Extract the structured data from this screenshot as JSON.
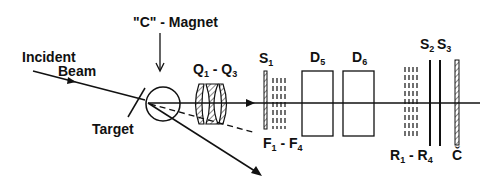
{
  "diagram": {
    "type": "experimental-setup-schematic",
    "labels": {
      "incident_beam_line1": "Incident",
      "incident_beam_line2": "Beam",
      "c_magnet": "\"C\" - Magnet",
      "target": "Target",
      "quads": {
        "a": "Q",
        "a_sub": "1",
        "sep": " - ",
        "b": "Q",
        "b_sub": "3"
      },
      "s1": {
        "main": "S",
        "sub": "1"
      },
      "d5": {
        "main": "D",
        "sub": "5"
      },
      "d6": {
        "main": "D",
        "sub": "6"
      },
      "f": {
        "a": "F",
        "a_sub": "1",
        "sep": " - ",
        "b": "F",
        "b_sub": "4"
      },
      "r": {
        "a": "R",
        "a_sub": "1",
        "sep": " - ",
        "b": "R",
        "b_sub": "4"
      },
      "s2": {
        "main": "S",
        "sub": "2"
      },
      "s3": {
        "main": "S",
        "sub": "3"
      },
      "cherenkov": "Č"
    },
    "components": [
      "incident-beam",
      "target",
      "c-magnet",
      "quadrupoles-Q1-Q3",
      "scintillator-S1",
      "chambers-F1-F4",
      "drift-chamber-D5",
      "drift-chamber-D6",
      "chambers-R1-R4",
      "scintillator-S2",
      "scintillator-S3",
      "cherenkov-counter"
    ],
    "colors": {
      "ink": "#111111",
      "background": "#ffffff"
    }
  }
}
